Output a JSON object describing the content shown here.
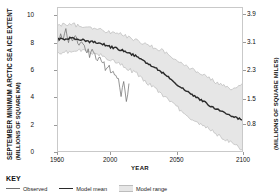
{
  "axes": {
    "y_left_title_line1": "SEPTEMBER MINIMUM ARCTIC SEA ICE EXTENT",
    "y_left_title_line2": "(MILLIONS OF SQUARE KM)",
    "y_right_title": "(MILLIONS OF SQUARE MILES)",
    "x_title": "YEAR"
  },
  "key": {
    "title": "KEY",
    "items": [
      {
        "label": "Observed",
        "style": "line"
      },
      {
        "label": "Model mean",
        "style": "line"
      },
      {
        "label": "Model range",
        "style": "band"
      }
    ]
  },
  "colors": {
    "background": "#ffffff",
    "frame": "#c9c9c9",
    "band_fill": "#e6e6e6",
    "band_edge": "#bdbdbd",
    "mean_line": "#2a2a2a",
    "observed_line": "#6f6f6f",
    "text": "#111111"
  },
  "chart_data": {
    "type": "line",
    "title": "",
    "xlabel": "YEAR",
    "ylabel": "SEPTEMBER MINIMUM ARCTIC SEA ICE EXTENT (MILLIONS OF SQUARE KM)",
    "ylabel_secondary": "(MILLIONS OF SQUARE MILES)",
    "grid": false,
    "legend_position": "below-plot",
    "xlim": [
      1960,
      2100
    ],
    "ylim": [
      0,
      10.6
    ],
    "xticks": [
      1960,
      2000,
      2050,
      2100
    ],
    "xticklabels": [
      "1960",
      "2000",
      "2050",
      "2100"
    ],
    "yticks_left": [
      0,
      2,
      4,
      6,
      8,
      10
    ],
    "yticklabels_left": [
      "0",
      "2",
      "4",
      "6",
      "8",
      "10"
    ],
    "yticks_right_km2": [
      2.07,
      3.88,
      5.96,
      8.03,
      10.1
    ],
    "yticklabels_right": [
      "0.8",
      "1.5",
      "2.3",
      "3.1",
      "3.9"
    ],
    "series": [
      {
        "name": "Model range",
        "style": "band",
        "x": [
          1960,
          1965,
          1970,
          1975,
          1980,
          1985,
          1990,
          1995,
          2000,
          2005,
          2010,
          2015,
          2020,
          2025,
          2030,
          2035,
          2040,
          2045,
          2050,
          2055,
          2060,
          2065,
          2070,
          2075,
          2080,
          2085,
          2090,
          2095,
          2100
        ],
        "upper": [
          9.3,
          9.4,
          9.4,
          9.3,
          9.2,
          9.1,
          9.0,
          8.9,
          8.8,
          8.7,
          8.6,
          8.4,
          8.2,
          8.0,
          7.8,
          7.6,
          7.4,
          7.1,
          6.8,
          6.5,
          6.2,
          5.9,
          5.6,
          5.4,
          5.1,
          4.9,
          4.7,
          4.6,
          5.0
        ],
        "lower": [
          7.2,
          7.3,
          7.4,
          7.5,
          7.4,
          7.3,
          7.2,
          7.0,
          6.8,
          6.6,
          6.3,
          6.0,
          5.7,
          5.3,
          4.9,
          4.5,
          4.1,
          3.7,
          3.3,
          2.9,
          2.5,
          2.2,
          1.9,
          1.6,
          1.3,
          1.0,
          0.7,
          0.4,
          0.1
        ]
      },
      {
        "name": "Model mean",
        "style": "line-thick",
        "x": [
          1960,
          1965,
          1970,
          1975,
          1980,
          1985,
          1990,
          1995,
          2000,
          2005,
          2010,
          2015,
          2020,
          2025,
          2030,
          2035,
          2040,
          2045,
          2050,
          2055,
          2060,
          2065,
          2070,
          2075,
          2080,
          2085,
          2090,
          2095,
          2100
        ],
        "values": [
          8.3,
          8.3,
          8.4,
          8.3,
          8.2,
          8.1,
          8.0,
          7.9,
          7.7,
          7.6,
          7.4,
          7.2,
          7.0,
          6.7,
          6.4,
          6.1,
          5.8,
          5.4,
          5.0,
          4.6,
          4.3,
          4.0,
          3.7,
          3.4,
          3.1,
          2.9,
          2.7,
          2.5,
          2.3
        ]
      },
      {
        "name": "Observed",
        "style": "line-noisy",
        "x": [
          1960,
          1962,
          1964,
          1966,
          1968,
          1970,
          1972,
          1974,
          1976,
          1978,
          1980,
          1982,
          1984,
          1986,
          1988,
          1990,
          1992,
          1994,
          1996,
          1998,
          2000,
          2002,
          2004,
          2006,
          2008,
          2010,
          2012,
          2014
        ],
        "values": [
          8.1,
          8.5,
          8.2,
          9.0,
          8.3,
          8.6,
          8.2,
          8.4,
          8.1,
          7.9,
          7.7,
          7.5,
          7.2,
          7.4,
          7.0,
          6.6,
          7.0,
          6.5,
          6.2,
          6.4,
          6.0,
          5.9,
          5.4,
          5.6,
          4.3,
          4.9,
          3.8,
          5.0
        ]
      }
    ]
  }
}
